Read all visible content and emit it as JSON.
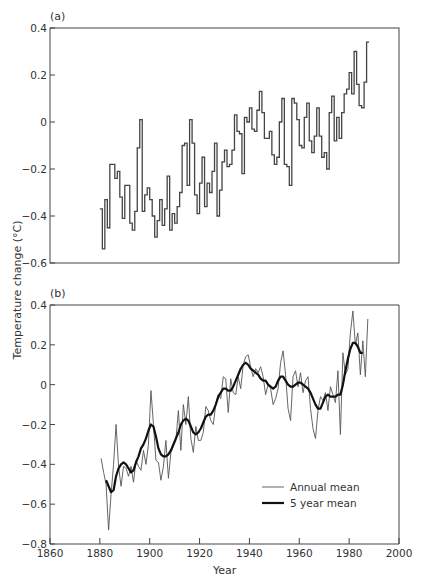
{
  "chart_data": [
    {
      "panel": "(a)",
      "type": "line",
      "style": "step",
      "title": "",
      "xlabel": "",
      "ylabel": "Temperature change (°C)",
      "xlim": [
        1860,
        2000
      ],
      "ylim": [
        -0.6,
        0.4
      ],
      "yticks": [
        -0.6,
        -0.4,
        -0.2,
        0,
        0.2,
        0.4
      ],
      "ytick_labels": [
        "−0.6",
        "−0.4",
        "−0.2",
        "0",
        "0.2",
        "0.4"
      ],
      "grid": false,
      "series": [
        {
          "name": "Annual mean",
          "x": [
            1880,
            1881,
            1882,
            1883,
            1884,
            1885,
            1886,
            1887,
            1888,
            1889,
            1890,
            1891,
            1892,
            1893,
            1894,
            1895,
            1896,
            1897,
            1898,
            1899,
            1900,
            1901,
            1902,
            1903,
            1904,
            1905,
            1906,
            1907,
            1908,
            1909,
            1910,
            1911,
            1912,
            1913,
            1914,
            1915,
            1916,
            1917,
            1918,
            1919,
            1920,
            1921,
            1922,
            1923,
            1924,
            1925,
            1926,
            1927,
            1928,
            1929,
            1930,
            1931,
            1932,
            1933,
            1934,
            1935,
            1936,
            1937,
            1938,
            1939,
            1940,
            1941,
            1942,
            1943,
            1944,
            1945,
            1946,
            1947,
            1948,
            1949,
            1950,
            1951,
            1952,
            1953,
            1954,
            1955,
            1956,
            1957,
            1958,
            1959,
            1960,
            1961,
            1962,
            1963,
            1964,
            1965,
            1966,
            1967,
            1968,
            1969,
            1970,
            1971,
            1972,
            1973,
            1974,
            1975,
            1976,
            1977,
            1978,
            1979,
            1980,
            1981,
            1982,
            1983,
            1984,
            1985,
            1986,
            1987
          ],
          "values": [
            -0.37,
            -0.54,
            -0.33,
            -0.45,
            -0.18,
            -0.18,
            -0.24,
            -0.21,
            -0.32,
            -0.41,
            -0.27,
            -0.27,
            -0.43,
            -0.46,
            -0.38,
            -0.11,
            0.01,
            -0.38,
            -0.31,
            -0.28,
            -0.33,
            -0.4,
            -0.49,
            -0.42,
            -0.33,
            -0.44,
            -0.37,
            -0.23,
            -0.46,
            -0.39,
            -0.43,
            -0.36,
            -0.3,
            -0.1,
            -0.09,
            -0.27,
            0.01,
            -0.09,
            -0.31,
            -0.39,
            -0.26,
            -0.15,
            -0.36,
            -0.26,
            -0.3,
            -0.21,
            -0.09,
            -0.4,
            -0.29,
            -0.17,
            -0.12,
            -0.19,
            -0.18,
            -0.12,
            0.03,
            -0.04,
            -0.05,
            -0.22,
            0.02,
            0.0,
            0.06,
            -0.03,
            -0.04,
            0.05,
            0.13,
            0.04,
            -0.07,
            -0.07,
            -0.04,
            -0.14,
            -0.18,
            -0.15,
            0.0,
            0.1,
            -0.18,
            -0.19,
            -0.27,
            0.1,
            0.08,
            0.01,
            -0.1,
            -0.11,
            0.02,
            0.08,
            -0.08,
            -0.13,
            -0.06,
            0.06,
            -0.06,
            -0.15,
            -0.13,
            -0.2,
            0.04,
            0.11,
            -0.08,
            0.02,
            -0.07,
            0.04,
            0.12,
            0.14,
            0.21,
            0.12,
            0.3,
            0.16,
            0.07,
            0.06,
            0.17,
            0.34
          ]
        }
      ]
    },
    {
      "panel": "(b)",
      "type": "line",
      "title": "",
      "xlabel": "Year",
      "ylabel": "Temperature change (°C)",
      "xlim": [
        1860,
        2000
      ],
      "ylim": [
        -0.8,
        0.4
      ],
      "xticks": [
        1860,
        1880,
        1900,
        1920,
        1940,
        1960,
        1980,
        2000
      ],
      "yticks": [
        -0.8,
        -0.6,
        -0.4,
        -0.2,
        0,
        0.2,
        0.4
      ],
      "ytick_labels": [
        "−0.8",
        "−0.6",
        "−0.4",
        "−0.2",
        "0",
        "0.2",
        "0.4"
      ],
      "grid": false,
      "legend_position": "lower right",
      "series": [
        {
          "name": "Annual mean",
          "x": [
            1880,
            1881,
            1882,
            1883,
            1884,
            1885,
            1886,
            1887,
            1888,
            1889,
            1890,
            1891,
            1892,
            1893,
            1894,
            1895,
            1896,
            1897,
            1898,
            1899,
            1900,
            1901,
            1902,
            1903,
            1904,
            1905,
            1906,
            1907,
            1908,
            1909,
            1910,
            1911,
            1912,
            1913,
            1914,
            1915,
            1916,
            1917,
            1918,
            1919,
            1920,
            1921,
            1922,
            1923,
            1924,
            1925,
            1926,
            1927,
            1928,
            1929,
            1930,
            1931,
            1932,
            1933,
            1934,
            1935,
            1936,
            1937,
            1938,
            1939,
            1940,
            1941,
            1942,
            1943,
            1944,
            1945,
            1946,
            1947,
            1948,
            1949,
            1950,
            1951,
            1952,
            1953,
            1954,
            1955,
            1956,
            1957,
            1958,
            1959,
            1960,
            1961,
            1962,
            1963,
            1964,
            1965,
            1966,
            1967,
            1968,
            1969,
            1970,
            1971,
            1972,
            1973,
            1974,
            1975,
            1976,
            1977,
            1978,
            1979,
            1980,
            1981,
            1982,
            1983,
            1984,
            1985,
            1986,
            1987
          ],
          "values": [
            -0.37,
            -0.44,
            -0.5,
            -0.73,
            -0.55,
            -0.4,
            -0.2,
            -0.41,
            -0.51,
            -0.41,
            -0.42,
            -0.46,
            -0.41,
            -0.49,
            -0.38,
            -0.41,
            -0.43,
            -0.33,
            -0.4,
            -0.3,
            -0.03,
            -0.2,
            -0.38,
            -0.39,
            -0.48,
            -0.41,
            -0.28,
            -0.47,
            -0.34,
            -0.31,
            -0.28,
            -0.13,
            -0.33,
            -0.1,
            -0.2,
            -0.06,
            -0.27,
            -0.34,
            -0.21,
            -0.28,
            -0.28,
            -0.24,
            -0.11,
            -0.13,
            -0.18,
            -0.2,
            -0.1,
            -0.05,
            -0.07,
            0.04,
            0.03,
            -0.14,
            0.03,
            -0.04,
            -0.05,
            0.04,
            -0.02,
            0.1,
            0.14,
            0.15,
            0.09,
            0.04,
            0.08,
            0.06,
            0.09,
            0.04,
            -0.05,
            0.0,
            -0.02,
            -0.1,
            -0.07,
            -0.02,
            0.11,
            0.17,
            0.05,
            -0.12,
            -0.18,
            0.04,
            0.07,
            -0.01,
            0.06,
            -0.04,
            0.02,
            0.04,
            -0.12,
            -0.22,
            -0.27,
            -0.13,
            -0.06,
            -0.08,
            -0.04,
            -0.13,
            -0.01,
            -0.05,
            -0.09,
            0.07,
            -0.25,
            0.16,
            0.05,
            0.08,
            0.26,
            0.37,
            0.2,
            0.26,
            0.05,
            0.22,
            0.04,
            0.33
          ]
        },
        {
          "name": "5 year mean",
          "x": [
            1882,
            1883,
            1884,
            1885,
            1886,
            1887,
            1888,
            1889,
            1890,
            1891,
            1892,
            1893,
            1894,
            1895,
            1896,
            1897,
            1898,
            1899,
            1900,
            1901,
            1902,
            1903,
            1904,
            1905,
            1906,
            1907,
            1908,
            1909,
            1910,
            1911,
            1912,
            1913,
            1914,
            1915,
            1916,
            1917,
            1918,
            1919,
            1920,
            1921,
            1922,
            1923,
            1924,
            1925,
            1926,
            1927,
            1928,
            1929,
            1930,
            1931,
            1932,
            1933,
            1934,
            1935,
            1936,
            1937,
            1938,
            1939,
            1940,
            1941,
            1942,
            1943,
            1944,
            1945,
            1946,
            1947,
            1948,
            1949,
            1950,
            1951,
            1952,
            1953,
            1954,
            1955,
            1956,
            1957,
            1958,
            1959,
            1960,
            1961,
            1962,
            1963,
            1964,
            1965,
            1966,
            1967,
            1968,
            1969,
            1970,
            1971,
            1972,
            1973,
            1974,
            1975,
            1976,
            1977,
            1978,
            1979,
            1980,
            1981,
            1982,
            1983,
            1984,
            1985
          ],
          "values": [
            -0.48,
            -0.51,
            -0.54,
            -0.53,
            -0.46,
            -0.42,
            -0.4,
            -0.39,
            -0.4,
            -0.42,
            -0.44,
            -0.43,
            -0.39,
            -0.36,
            -0.32,
            -0.3,
            -0.27,
            -0.23,
            -0.2,
            -0.21,
            -0.26,
            -0.32,
            -0.35,
            -0.36,
            -0.36,
            -0.35,
            -0.33,
            -0.3,
            -0.27,
            -0.24,
            -0.2,
            -0.18,
            -0.17,
            -0.18,
            -0.21,
            -0.24,
            -0.25,
            -0.24,
            -0.22,
            -0.19,
            -0.16,
            -0.15,
            -0.15,
            -0.13,
            -0.1,
            -0.06,
            -0.04,
            -0.02,
            -0.02,
            -0.03,
            -0.03,
            -0.01,
            0.02,
            0.05,
            0.08,
            0.1,
            0.11,
            0.1,
            0.08,
            0.07,
            0.06,
            0.05,
            0.03,
            0.02,
            0.02,
            0.0,
            -0.01,
            -0.02,
            -0.01,
            0.02,
            0.04,
            0.04,
            0.02,
            0.0,
            -0.01,
            -0.01,
            0.0,
            0.01,
            0.01,
            0.0,
            -0.01,
            -0.02,
            -0.04,
            -0.07,
            -0.1,
            -0.12,
            -0.12,
            -0.09,
            -0.06,
            -0.05,
            -0.06,
            -0.06,
            -0.06,
            -0.05,
            -0.05,
            0.0,
            0.07,
            0.13,
            0.18,
            0.21,
            0.21,
            0.19,
            0.16,
            0.16
          ]
        }
      ]
    }
  ],
  "labels": {
    "panel_a": "(a)",
    "panel_b": "(b)",
    "ylabel": "Temperature change (°C)",
    "xlabel": "Year",
    "legend_annual": "Annual mean",
    "legend_five_year": "5 year mean"
  },
  "colors": {
    "axis": "#444444",
    "annual_line": "#555555",
    "five_year_line": "#111111",
    "text": "#333333"
  }
}
